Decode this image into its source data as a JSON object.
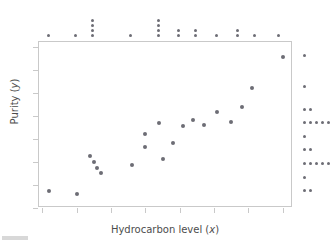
{
  "chart_data": {
    "type": "scatter",
    "title": "",
    "xlabel": "Hydrocarbon level (x)",
    "ylabel": "Purity (y)",
    "xlim": [
      0.84,
      1.58
    ],
    "ylim": [
      86,
      100.4
    ],
    "xticks": [
      "0.85",
      "0.95",
      "1.05",
      "1.15",
      "1.25",
      "1.35",
      "1.45",
      "1.55"
    ],
    "xtick_values": [
      0.85,
      0.95,
      1.05,
      1.15,
      1.25,
      1.35,
      1.45,
      1.55
    ],
    "yticks": [
      "86",
      "88",
      "90",
      "92",
      "94",
      "96",
      "98",
      "100"
    ],
    "ytick_values": [
      86,
      88,
      90,
      92,
      94,
      96,
      98,
      100
    ],
    "grid": false,
    "legend": null,
    "marker_color": "#6d6d75",
    "frame_color": "#c9c9c9",
    "x": [
      0.87,
      0.95,
      0.99,
      1.0,
      1.01,
      1.02,
      1.11,
      1.15,
      1.15,
      1.19,
      1.2,
      1.23,
      1.26,
      1.29,
      1.32,
      1.36,
      1.4,
      1.43,
      1.46,
      1.55
    ],
    "y": [
      87.5,
      87.2,
      90.5,
      89.95,
      89.45,
      89.0,
      89.7,
      92.4,
      91.3,
      93.4,
      90.25,
      91.6,
      93.1,
      93.6,
      93.2,
      94.3,
      93.45,
      94.8,
      96.45,
      99.1
    ],
    "points": [
      {
        "x": 0.87,
        "y": 87.5
      },
      {
        "x": 0.95,
        "y": 87.2
      },
      {
        "x": 0.99,
        "y": 90.5
      },
      {
        "x": 1.0,
        "y": 89.95
      },
      {
        "x": 1.01,
        "y": 89.45
      },
      {
        "x": 1.02,
        "y": 89.0
      },
      {
        "x": 1.11,
        "y": 89.7
      },
      {
        "x": 1.15,
        "y": 92.4
      },
      {
        "x": 1.15,
        "y": 91.3
      },
      {
        "x": 1.19,
        "y": 93.4
      },
      {
        "x": 1.2,
        "y": 90.25
      },
      {
        "x": 1.23,
        "y": 91.6
      },
      {
        "x": 1.26,
        "y": 93.1
      },
      {
        "x": 1.29,
        "y": 93.6
      },
      {
        "x": 1.32,
        "y": 93.2
      },
      {
        "x": 1.36,
        "y": 94.3
      },
      {
        "x": 1.4,
        "y": 93.45
      },
      {
        "x": 1.43,
        "y": 94.8
      },
      {
        "x": 1.46,
        "y": 96.45
      },
      {
        "x": 1.55,
        "y": 99.1
      }
    ],
    "marginal_top": {
      "description": "dot plot of hydrocarbon level (x) distribution above the axis",
      "stacks": [
        {
          "x": 0.87,
          "count": 1
        },
        {
          "x": 0.95,
          "count": 1
        },
        {
          "x": 1.0,
          "count": 4
        },
        {
          "x": 1.11,
          "count": 1
        },
        {
          "x": 1.19,
          "count": 4
        },
        {
          "x": 1.25,
          "count": 2
        },
        {
          "x": 1.3,
          "count": 2
        },
        {
          "x": 1.36,
          "count": 1
        },
        {
          "x": 1.42,
          "count": 2
        },
        {
          "x": 1.47,
          "count": 1
        },
        {
          "x": 1.54,
          "count": 1
        }
      ]
    },
    "marginal_right": {
      "description": "dot plot of purity (y) distribution to the right of the axis",
      "stacks": [
        {
          "y": 99.1,
          "count": 1
        },
        {
          "y": 96.45,
          "count": 1
        },
        {
          "y": 94.5,
          "count": 2
        },
        {
          "y": 93.35,
          "count": 5
        },
        {
          "y": 92.1,
          "count": 1
        },
        {
          "y": 90.95,
          "count": 2
        },
        {
          "y": 89.75,
          "count": 5
        },
        {
          "y": 88.6,
          "count": 1
        },
        {
          "y": 87.4,
          "count": 2
        }
      ]
    }
  },
  "axes": {
    "xlabel_text": "Hydrocarbon level (",
    "xlabel_var": "x",
    "xlabel_close": ")",
    "ylabel_text": "Purity (",
    "ylabel_var": "y",
    "ylabel_close": ")"
  }
}
